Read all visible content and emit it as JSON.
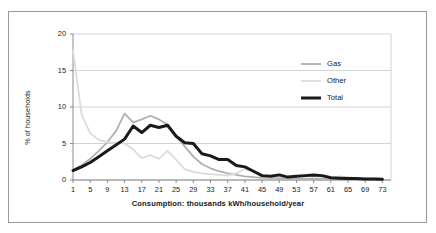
{
  "chart_data": {
    "type": "line",
    "title": "",
    "xlabel": "Consumption: thousands kWh/household/year",
    "ylabel": "% of households",
    "xlim": [
      1,
      75
    ],
    "ylim": [
      0,
      20
    ],
    "xticks": [
      1,
      5,
      9,
      13,
      17,
      21,
      25,
      29,
      33,
      37,
      41,
      45,
      49,
      53,
      57,
      61,
      65,
      69,
      73
    ],
    "yticks": [
      0,
      5,
      10,
      15,
      20
    ],
    "grid": "horizontal",
    "legend_position": "top-right",
    "x": [
      1,
      3,
      5,
      7,
      9,
      11,
      13,
      15,
      17,
      19,
      21,
      23,
      25,
      27,
      29,
      31,
      33,
      35,
      37,
      39,
      41,
      43,
      45,
      47,
      49,
      51,
      53,
      55,
      57,
      59,
      61,
      63,
      65,
      67,
      69,
      71,
      73
    ],
    "series": [
      {
        "name": "Gas",
        "color": "#b0b0b0",
        "width": 1.8,
        "values": [
          1.4,
          2.0,
          2.9,
          4.0,
          5.2,
          6.7,
          9.1,
          7.9,
          8.3,
          8.8,
          8.3,
          7.6,
          6.0,
          4.6,
          3.2,
          2.2,
          1.6,
          1.2,
          0.9,
          0.7,
          0.5,
          0.4,
          0.3,
          0.3,
          0.25,
          0.2,
          0.2,
          0.2,
          0.2,
          0.15,
          0.15,
          0.15,
          0.1,
          0.1,
          0.1,
          0.1,
          0.1
        ]
      },
      {
        "name": "Other",
        "color": "#dcdcdc",
        "width": 1.8,
        "values": [
          17.8,
          9.0,
          6.4,
          5.5,
          5.2,
          5.1,
          5.0,
          4.2,
          3.0,
          3.4,
          2.9,
          4.0,
          2.8,
          1.5,
          1.1,
          0.9,
          0.8,
          0.7,
          0.6,
          0.9,
          1.5,
          1.2,
          0.5,
          0.4,
          0.5,
          0.4,
          0.45,
          0.6,
          0.55,
          0.4,
          0.3,
          0.5,
          0.4,
          0.25,
          0.2,
          0.25,
          0.2
        ]
      },
      {
        "name": "Total",
        "color": "#1a1a1a",
        "width": 3.0,
        "values": [
          1.3,
          1.8,
          2.4,
          3.2,
          4.0,
          4.8,
          5.6,
          7.4,
          6.5,
          7.5,
          7.2,
          7.5,
          6.0,
          5.1,
          5.0,
          3.6,
          3.3,
          2.8,
          2.8,
          2.0,
          1.8,
          1.2,
          0.6,
          0.5,
          0.7,
          0.4,
          0.5,
          0.6,
          0.7,
          0.6,
          0.3,
          0.25,
          0.2,
          0.2,
          0.15,
          0.15,
          0.1
        ]
      }
    ]
  },
  "axes": {
    "x_title": "Consumption: thousands kWh/household/year",
    "y_title": "% of households",
    "x_tick_labels": [
      "1",
      "5",
      "9",
      "13",
      "17",
      "21",
      "25",
      "29",
      "33",
      "37",
      "41",
      "45",
      "49",
      "53",
      "57",
      "61",
      "65",
      "69",
      "73"
    ],
    "y_tick_labels": [
      "0",
      "5",
      "10",
      "15",
      "20"
    ]
  },
  "legend": {
    "entries": [
      {
        "label": "Gas",
        "color": "#b0b0b0"
      },
      {
        "label": "Other",
        "color": "#dcdcdc"
      },
      {
        "label": "Total",
        "color": "#1a1a1a"
      }
    ]
  },
  "colors": {
    "frame_border": "#9a9a9a",
    "gridline": "#c8c8c8",
    "axis": "#808080",
    "text": "#1a1a1a",
    "background": "#ffffff"
  }
}
